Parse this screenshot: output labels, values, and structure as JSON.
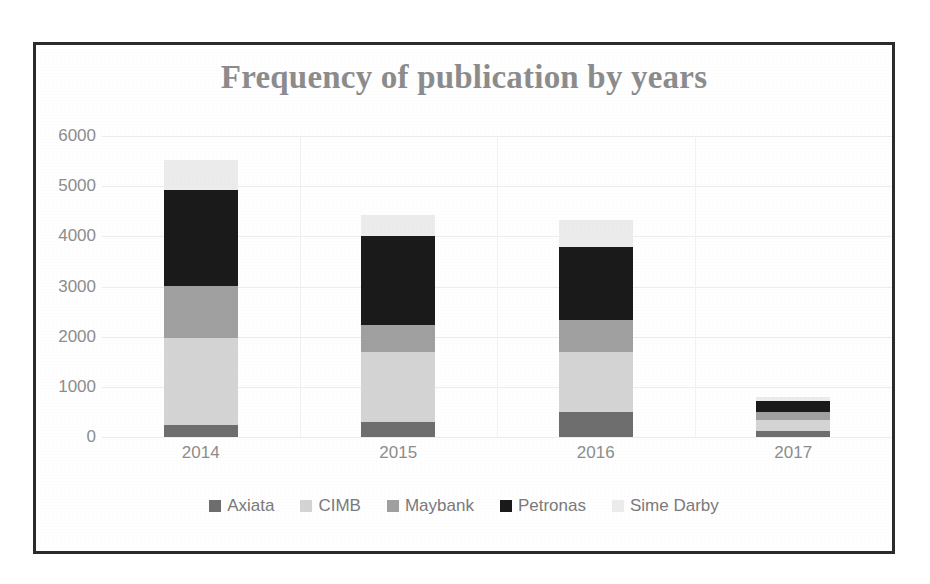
{
  "chart_data": {
    "type": "bar",
    "subtype": "stacked-column",
    "title": "Frequency of publication by years",
    "xlabel": "",
    "ylabel": "",
    "categories": [
      "2014",
      "2015",
      "2016",
      "2017"
    ],
    "ylim": [
      0,
      6000
    ],
    "ytick_values": [
      0,
      1000,
      2000,
      3000,
      4000,
      5000,
      6000
    ],
    "ytick_labels": [
      "0",
      "1000",
      "2000",
      "3000",
      "4000",
      "5000",
      "6000"
    ],
    "grid": true,
    "legend_position": "bottom",
    "series": [
      {
        "name": "Axiata",
        "color": "#6e6e6e",
        "values": [
          240,
          290,
          490,
          110
        ]
      },
      {
        "name": "CIMB",
        "color": "#d4d4d4",
        "values": [
          1730,
          1410,
          1200,
          230
        ]
      },
      {
        "name": "Maybank",
        "color": "#a0a0a0",
        "values": [
          1050,
          540,
          640,
          160
        ]
      },
      {
        "name": "Petronas",
        "color": "#1a1a1a",
        "values": [
          1900,
          1760,
          1460,
          210
        ]
      },
      {
        "name": "Sime Darby",
        "color": "#ececec",
        "values": [
          600,
          430,
          530,
          90
        ]
      }
    ],
    "totals": [
      5520,
      4430,
      4320,
      800
    ]
  },
  "chart": {
    "title": "Frequency of publication by years",
    "title_color": "#8c8c8c",
    "axis_label_color": "#8d8d8d",
    "border_color": "#2b2b2b",
    "background": "#ffffff",
    "gridline_color": "#ededed"
  },
  "legend": {
    "items": [
      {
        "label": "Axiata",
        "color": "#6e6e6e"
      },
      {
        "label": "CIMB",
        "color": "#d4d4d4"
      },
      {
        "label": "Maybank",
        "color": "#a0a0a0"
      },
      {
        "label": "Petronas",
        "color": "#1a1a1a"
      },
      {
        "label": "Sime Darby",
        "color": "#ececec"
      }
    ]
  }
}
